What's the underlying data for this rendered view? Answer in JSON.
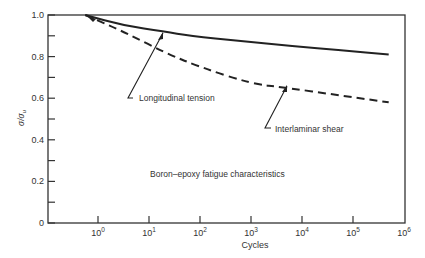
{
  "chart_data": {
    "type": "line",
    "title": "Boron–epoxy fatigue characteristics",
    "xlabel": "Cycles",
    "ylabel": "σ/σu",
    "xscale": "log",
    "xlim_log10": [
      -1,
      6
    ],
    "ylim": [
      0,
      1.0
    ],
    "x_ticks": [
      "10⁰",
      "10¹",
      "10²",
      "10³",
      "10⁴",
      "10⁵",
      "10⁶"
    ],
    "x_tick_exponents": [
      0,
      1,
      2,
      3,
      4,
      5,
      6
    ],
    "y_ticks": [
      "0",
      "0.2",
      "0.4",
      "0.6",
      "0.8",
      "1.0"
    ],
    "y_tick_values": [
      0,
      0.2,
      0.4,
      0.6,
      0.8,
      1.0
    ],
    "y_minor_ticks": [
      0.1,
      0.3,
      0.5,
      0.7,
      0.9
    ],
    "grid": false,
    "series": [
      {
        "name": "Longitudinal tension",
        "style": "solid",
        "log10_cycles": [
          -0.25,
          0.5,
          1.3,
          1.8,
          2.8,
          3.8,
          4.8,
          5.7
        ],
        "values": [
          1.0,
          0.95,
          0.92,
          0.9,
          0.875,
          0.85,
          0.83,
          0.81
        ]
      },
      {
        "name": "Interlaminar shear",
        "style": "dashed",
        "log10_cycles": [
          -0.25,
          0.5,
          1.3,
          2.0,
          3.0,
          3.7,
          4.7,
          5.7
        ],
        "values": [
          1.0,
          0.92,
          0.82,
          0.75,
          0.67,
          0.65,
          0.615,
          0.58
        ]
      }
    ],
    "annotations": [
      {
        "text": "Longitudinal tension",
        "points_to_log10": 1.3,
        "points_to_value": 0.92
      },
      {
        "text": "Interlaminar shear",
        "points_to_log10": 3.7,
        "points_to_value": 0.65
      },
      {
        "text": "Boron–epoxy fatigue characteristics"
      }
    ]
  },
  "labels": {
    "ylabel_sigma": "σ/σ",
    "ylabel_sub": "u",
    "xlabel": "Cycles",
    "caption": "Boron–epoxy fatigue characteristics",
    "series1": "Longitudinal tension",
    "series2": "Interlaminar shear"
  }
}
